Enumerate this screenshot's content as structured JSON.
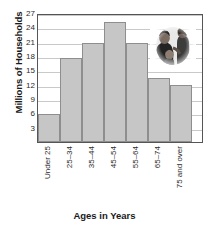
{
  "chart_data": {
    "type": "bar",
    "title": "",
    "xlabel": "Ages in Years",
    "ylabel": "Millions of Households",
    "categories": [
      "Under 25",
      "25–34",
      "35–44",
      "45–54",
      "55–64",
      "65–74",
      "75 and over"
    ],
    "values": [
      5.8,
      17.5,
      20.7,
      25.2,
      20.8,
      13.3,
      12.0
    ],
    "yticks": [
      3,
      6,
      9,
      12,
      15,
      18,
      21,
      24,
      27
    ],
    "ytick_labels": [
      "3",
      "6",
      "9",
      "12",
      "15",
      "18",
      "21",
      "24",
      "27"
    ],
    "ylim": [
      0,
      27
    ],
    "grid": true,
    "legend": "none",
    "bar_color": "#c6c6c6",
    "bar_edge_color": "#8e8e8e",
    "grid_color": "#c9c9c9",
    "frame_color": "#555555"
  },
  "inset": {
    "image_name": "family-photo",
    "description": "grayscale oval vignette photograph of a family"
  }
}
